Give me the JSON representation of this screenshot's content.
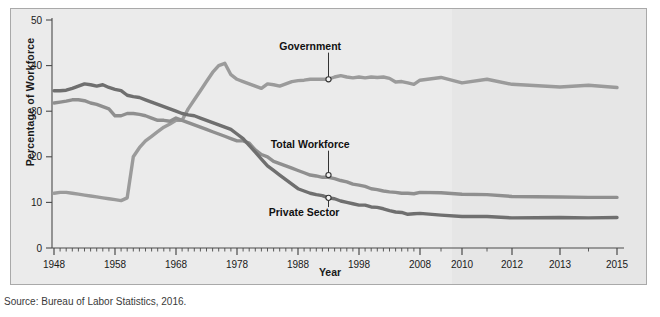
{
  "figure": {
    "source_note": "Source: Bureau of Labor Statistics, 2016.",
    "background": "#ebebeb",
    "border_color": "#a9a9a9"
  },
  "chart_data": {
    "type": "line",
    "title": "",
    "xlabel": "Year",
    "ylabel": "Percentage of Workforce",
    "xlim": [
      1948,
      2015
    ],
    "ylim": [
      0,
      50
    ],
    "yticks": [
      0,
      10,
      20,
      30,
      40,
      50
    ],
    "xticks": [
      1948,
      1958,
      1968,
      1978,
      1988,
      1998,
      2008,
      2010,
      2012,
      2013,
      2015
    ],
    "xtick_labels": [
      "1948",
      "1958",
      "1968",
      "1978",
      "1988",
      "1998",
      "2008",
      "2010",
      "2012",
      "2013",
      "2015"
    ],
    "minor_xticks": "every year",
    "grid": false,
    "legend": "annotated callouts on lines",
    "series": [
      {
        "name": "Government",
        "color": "#9b9b9b",
        "label_anchor": {
          "year": 1993,
          "value": 37.0
        },
        "label_text_pos": {
          "year": 1990,
          "value": 43.5
        },
        "x": [
          1948,
          1949,
          1950,
          1951,
          1952,
          1953,
          1954,
          1955,
          1956,
          1957,
          1958,
          1959,
          1960,
          1961,
          1962,
          1963,
          1964,
          1965,
          1966,
          1967,
          1968,
          1969,
          1970,
          1971,
          1972,
          1973,
          1974,
          1975,
          1976,
          1977,
          1978,
          1979,
          1980,
          1981,
          1982,
          1983,
          1984,
          1985,
          1986,
          1987,
          1988,
          1989,
          1990,
          1991,
          1992,
          1993,
          1994,
          1995,
          1996,
          1997,
          1998,
          1999,
          2000,
          2001,
          2002,
          2003,
          2004,
          2005,
          2006,
          2007,
          2008,
          2009,
          2010,
          2011,
          2012,
          2013,
          2014,
          2015
        ],
        "y": [
          12.0,
          12.2,
          12.2,
          12.0,
          11.8,
          11.6,
          11.4,
          11.2,
          11.0,
          10.8,
          10.6,
          10.4,
          11.0,
          20.0,
          22.0,
          23.5,
          24.5,
          25.5,
          26.5,
          27.2,
          28.0,
          28.0,
          30.5,
          32.5,
          34.5,
          36.5,
          38.5,
          40.0,
          40.5,
          38.0,
          37.0,
          36.5,
          36.0,
          35.5,
          35.0,
          36.0,
          35.8,
          35.5,
          36.0,
          36.5,
          36.7,
          36.8,
          37.0,
          37.0,
          37.0,
          37.0,
          37.5,
          37.8,
          37.5,
          37.3,
          37.5,
          37.3,
          37.5,
          37.4,
          37.5,
          37.2,
          36.4,
          36.5,
          36.2,
          35.9,
          36.8,
          37.4,
          36.2,
          37.0,
          35.9,
          35.3,
          35.7,
          35.2
        ]
      },
      {
        "name": "Total Workforce",
        "color": "#8f8f8f",
        "label_anchor": {
          "year": 1993,
          "value": 16.0
        },
        "label_text_pos": {
          "year": 1990,
          "value": 22.0
        },
        "x": [
          1948,
          1949,
          1950,
          1951,
          1952,
          1953,
          1954,
          1955,
          1956,
          1957,
          1958,
          1959,
          1960,
          1961,
          1962,
          1963,
          1964,
          1965,
          1966,
          1967,
          1968,
          1969,
          1970,
          1971,
          1972,
          1973,
          1974,
          1975,
          1976,
          1977,
          1978,
          1979,
          1980,
          1981,
          1982,
          1983,
          1984,
          1985,
          1986,
          1987,
          1988,
          1989,
          1990,
          1991,
          1992,
          1993,
          1994,
          1995,
          1996,
          1997,
          1998,
          1999,
          2000,
          2001,
          2002,
          2003,
          2004,
          2005,
          2006,
          2007,
          2008,
          2009,
          2010,
          2011,
          2012,
          2013,
          2014,
          2015
        ],
        "y": [
          31.8,
          32.0,
          32.2,
          32.5,
          32.5,
          32.3,
          31.8,
          31.5,
          31.0,
          30.5,
          29.0,
          29.0,
          29.5,
          29.5,
          29.3,
          29.0,
          28.5,
          28.0,
          28.0,
          27.8,
          28.5,
          28.0,
          27.5,
          27.0,
          26.5,
          26.0,
          25.5,
          25.0,
          24.5,
          24.0,
          23.5,
          23.5,
          23.0,
          21.5,
          20.5,
          20.0,
          19.0,
          18.5,
          18.0,
          17.5,
          17.0,
          16.5,
          16.0,
          15.8,
          15.5,
          15.5,
          15.2,
          14.8,
          14.5,
          14.0,
          13.8,
          13.5,
          13.0,
          12.8,
          12.5,
          12.3,
          12.2,
          12.0,
          12.0,
          11.9,
          12.2,
          12.1,
          11.8,
          11.7,
          11.3,
          11.2,
          11.1,
          11.1
        ]
      },
      {
        "name": "Private Sector",
        "color": "#6f6f6f",
        "label_anchor": {
          "year": 1993,
          "value": 11.0
        },
        "label_text_pos": {
          "year": 1989,
          "value": 7.0
        },
        "x": [
          1948,
          1949,
          1950,
          1951,
          1952,
          1953,
          1954,
          1955,
          1956,
          1957,
          1958,
          1959,
          1960,
          1961,
          1962,
          1963,
          1964,
          1965,
          1966,
          1967,
          1968,
          1969,
          1970,
          1971,
          1972,
          1973,
          1974,
          1975,
          1976,
          1977,
          1978,
          1979,
          1980,
          1981,
          1982,
          1983,
          1984,
          1985,
          1986,
          1987,
          1988,
          1989,
          1990,
          1991,
          1992,
          1993,
          1994,
          1995,
          1996,
          1997,
          1998,
          1999,
          2000,
          2001,
          2002,
          2003,
          2004,
          2005,
          2006,
          2007,
          2008,
          2009,
          2010,
          2011,
          2012,
          2013,
          2014,
          2015
        ],
        "y": [
          34.5,
          34.5,
          34.6,
          35.0,
          35.5,
          36.0,
          35.8,
          35.5,
          35.8,
          35.2,
          34.8,
          34.5,
          33.5,
          33.2,
          33.0,
          32.5,
          32.0,
          31.5,
          31.0,
          30.5,
          30.0,
          29.5,
          29.2,
          29.0,
          28.5,
          28.0,
          27.5,
          27.0,
          26.5,
          26.0,
          25.0,
          24.0,
          22.5,
          21.0,
          19.5,
          18.0,
          17.0,
          16.0,
          15.0,
          14.0,
          13.0,
          12.5,
          12.0,
          11.7,
          11.5,
          11.0,
          10.8,
          10.3,
          10.0,
          9.7,
          9.4,
          9.4,
          9.0,
          8.9,
          8.6,
          8.2,
          7.9,
          7.8,
          7.4,
          7.5,
          7.6,
          7.2,
          6.9,
          6.9,
          6.6,
          6.7,
          6.6,
          6.7
        ]
      }
    ]
  }
}
